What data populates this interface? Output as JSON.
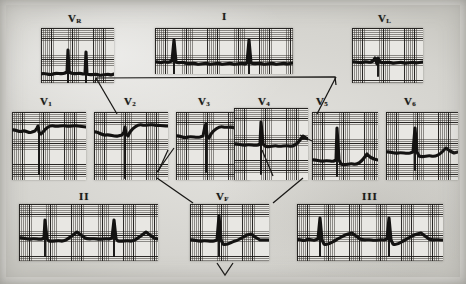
{
  "figure": {
    "kind": "scanned-12-lead-electrocardiogram",
    "background_color": "#d9d8d3",
    "paper_color": "#e4e3df",
    "grid_color": "#1e1c1a",
    "trace_color": "#131211"
  },
  "leads": {
    "row_top": [
      {
        "id": "aVR",
        "label": "V",
        "subscript": "R",
        "x": 41,
        "y": 28,
        "w": 73,
        "h": 55,
        "label_x": 68,
        "label_y": 12,
        "trace": "M0,46 C4,44 8,48 12,46 C16,44 20,47 24,45 L26,44 L27,22 L28,44 L30,45 C34,47 38,44 42,46 L44,46 L45,24 L46,46 C50,48 54,45 58,47 C62,48 66,45 70,47 L73,46",
        "spike": "M27,22 L27,82 M45,24 L45,82"
      },
      {
        "id": "I",
        "label": "I",
        "subscript": "",
        "x": 155,
        "y": 28,
        "w": 138,
        "h": 46,
        "label_x": 222,
        "label_y": 10,
        "trace": "M0,34 C3,33 5,36 8,34 C10,33 12,35 14,34 L17,33 L19,12 L21,34 C24,36 27,33 30,35 C34,37 38,34 42,36 C46,37 50,34 54,36 C58,37 62,34 66,36 C70,37 74,34 78,36 C82,37 86,34 90,36 L92,35 L94,12 L96,35 C100,37 104,34 108,36 C112,37 116,34 120,36 C124,37 128,34 132,36 L138,35",
        "spike": "M19,12 L19,46 M94,12 L94,46"
      },
      {
        "id": "aVL",
        "label": "V",
        "subscript": "L",
        "x": 352,
        "y": 28,
        "w": 71,
        "h": 55,
        "label_x": 378,
        "label_y": 12,
        "trace": "M0,34 C4,33 8,36 12,34 C15,33 17,35 19,34 L21,33 L23,30 L25,36 L26,30 L28,34 C32,36 36,33 40,35 C44,36 48,33 52,35 C56,36 60,33 64,35 L71,34",
        "spike": "M26,30 L26,48"
      }
    ],
    "row_middle": [
      {
        "id": "V1",
        "label": "V",
        "subscript": "1",
        "x": 12,
        "y": 112,
        "w": 74,
        "h": 68,
        "label_x": 40,
        "label_y": 95,
        "trace": "M0,18 C4,17 7,21 11,19 C14,18 17,22 20,20 L23,19 L25,16 L26,14 L27,20 L29,22 L31,20 C34,16 38,13 42,14 C46,15 50,13 54,14 C58,15 62,13 66,14 L74,15",
        "spike": "M27,16 L27,62"
      },
      {
        "id": "V2",
        "label": "V",
        "subscript": "2",
        "x": 94,
        "y": 112,
        "w": 74,
        "h": 68,
        "label_x": 124,
        "label_y": 95,
        "trace": "M0,20 C4,19 8,24 12,23 C16,22 20,25 24,24 L28,23 L30,20 L31,15 L32,22 L34,24 L36,20 C40,15 44,12 48,13 C52,14 56,12 60,13 C64,14 68,13 72,14 L74,14",
        "spike": "M31,15 L31,66"
      },
      {
        "id": "V3",
        "label": "V",
        "subscript": "3",
        "x": 176,
        "y": 112,
        "w": 74,
        "h": 68,
        "label_x": 198,
        "label_y": 95,
        "trace": "M0,24 C4,23 8,27 12,25 C16,24 20,26 24,25 L27,24 L29,14 L30,12 L31,24 L33,26 L35,22 C39,17 43,14 47,15 C51,16 55,14 59,16 C63,17 67,14 71,16 L74,15",
        "spike": "M30,12 L30,60"
      },
      {
        "id": "V4",
        "label": "V",
        "subscript": "4",
        "x": 234,
        "y": 108,
        "w": 74,
        "h": 72,
        "label_x": 258,
        "label_y": 95,
        "trace": "M0,36 C4,35 8,38 12,37 C16,36 20,38 24,37 L26,36 L27,14 L29,36 L31,38 C35,40 39,37 43,38 C47,39 51,37 55,38 C59,39 63,36 66,32 L69,28 L72,30 L74,31",
        "spike": "M27,14 L27,66"
      },
      {
        "id": "V5",
        "label": "V",
        "subscript": "5",
        "x": 312,
        "y": 112,
        "w": 66,
        "h": 68,
        "label_x": 316,
        "label_y": 95,
        "trace": "M0,48 C4,47 8,50 12,49 C16,48 20,50 22,49 L24,48 L25,16 L27,48 L29,52 C33,54 37,51 41,52 C45,53 49,50 52,46 L55,42 L58,45 L62,47 L66,48",
        "spike": "M25,16 L25,64"
      },
      {
        "id": "V6",
        "label": "V",
        "subscript": "6",
        "x": 386,
        "y": 112,
        "w": 72,
        "h": 68,
        "label_x": 404,
        "label_y": 95,
        "trace": "M0,40 C4,39 8,42 12,41 C16,40 20,42 24,41 L27,40 L29,16 L31,40 L33,44 C37,46 41,43 45,44 C49,45 53,43 56,40 L60,36 L64,39 L68,41 L72,40",
        "spike": "M29,16 L29,58"
      }
    ],
    "row_bottom": [
      {
        "id": "II",
        "label": "II",
        "subscript": "",
        "x": 19,
        "y": 204,
        "w": 139,
        "h": 57,
        "label_x": 79,
        "label_y": 190,
        "trace": "M0,34 C4,33 8,36 12,35 C16,34 20,36 23,35 L25,34 L26,16 L28,35 L30,37 C34,38 38,36 42,37 C46,38 50,34 54,31 L58,28 L62,31 L66,34 C70,36 74,34 78,35 C82,36 86,34 90,35 L93,34 L95,16 L97,35 L99,37 C103,38 107,36 111,37 C115,38 119,34 123,31 L127,28 L131,31 L135,34 L139,35",
        "spike": "M26,16 L26,52 M95,16 L95,52"
      },
      {
        "id": "aVF",
        "label": "V",
        "subscript": "F",
        "x": 190,
        "y": 204,
        "w": 79,
        "h": 57,
        "label_x": 216,
        "label_y": 190,
        "trace": "M0,36 C4,35 8,38 12,37 C16,36 20,38 24,37 L27,36 L29,12 L31,36 L33,40 C37,42 41,38 45,37 C49,36 53,33 57,31 L61,30 L65,33 L70,36 L79,36",
        "spike": "M29,12 L29,52"
      },
      {
        "id": "III",
        "label": "III",
        "subscript": "",
        "x": 297,
        "y": 204,
        "w": 146,
        "h": 57,
        "label_x": 362,
        "label_y": 190,
        "trace": "M0,36 C3,34 6,38 9,36 C12,34 15,37 18,36 L21,35 L23,14 L25,36 L27,40 C31,42 35,38 39,36 C43,34 47,31 51,30 L55,29 L59,32 L63,35 C67,37 71,35 75,36 C79,37 83,35 87,36 L90,35 L92,14 L94,36 L96,40 C100,42 104,38 108,36 C112,34 116,31 120,30 L124,29 L128,32 L132,35 C136,37 140,35 144,36 L146,36",
        "spike": "M23,14 L23,52 M92,14 L92,52"
      }
    ]
  },
  "connectors": {
    "top_bracket": "M95,82 L96,78 L335,77 L336,84",
    "leg_v2": "M96,78 L118,116",
    "leg_v5": "M336,77 L318,116",
    "leg_v3_down": "M168,151 L196,200",
    "leg_v4_down": "M262,151 L266,155",
    "chevron_left": "M156,180 L194,202",
    "chevron_right": "M272,202 L300,178",
    "arrow_down": "M216,264 L224,275 L232,264"
  }
}
